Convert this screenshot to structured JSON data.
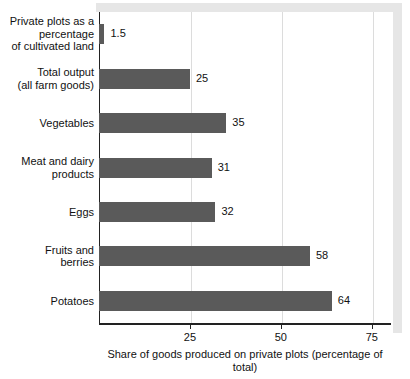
{
  "chart_data": {
    "type": "bar",
    "orientation": "horizontal",
    "title": "",
    "xlabel": "Share of goods produced on private plots (percentage of total)",
    "ylabel": "",
    "xlim": [
      0,
      80
    ],
    "xticks": [
      25,
      50,
      75
    ],
    "xtick_labels": [
      "25",
      "50",
      "75"
    ],
    "grid": true,
    "legend": false,
    "bar_color": "#5a5a5a",
    "categories": [
      "Private plots as a\npercentage\nof cultivated land",
      "Total output\n(all farm goods)",
      "Vegetables",
      "Meat and dairy\nproducts",
      "Eggs",
      "Fruits and\nberries",
      "Potatoes"
    ],
    "values": [
      1.5,
      25,
      35,
      31,
      32,
      58,
      64
    ],
    "value_labels": [
      "1.5",
      "25",
      "35",
      "31",
      "32",
      "58",
      "64"
    ]
  }
}
